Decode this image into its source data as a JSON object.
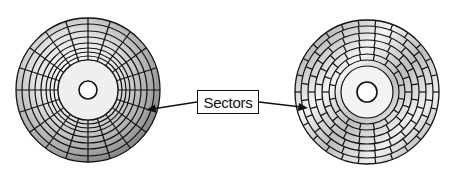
{
  "diagram": {
    "label": "Sectors",
    "left_disk": {
      "description": "Disk with fixed sector count per track (radial spokes)",
      "tracks": 8,
      "sectors_per_track": 20
    },
    "right_disk": {
      "description": "Disk with zoned bit recording (more sectors on outer tracks)",
      "zones": 4
    },
    "colors": {
      "line": "#111111",
      "disk_light": "#f2f2f2",
      "disk_dark": "#8a8a8a"
    }
  }
}
